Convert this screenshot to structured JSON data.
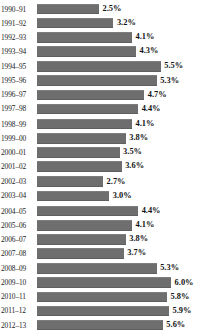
{
  "chart_data": {
    "type": "bar",
    "orientation": "horizontal",
    "title": "",
    "subtitle": "",
    "xlabel": "",
    "ylabel": "",
    "grid": false,
    "legend": null,
    "axis_visible": false,
    "tick_labels_x": [],
    "value_suffix": "%",
    "xlim": [
      0,
      6.6
    ],
    "bar_color": "#6e6e6e",
    "background_color": "#ffffff",
    "label_color": "#1a1a1a",
    "value_color": "#111111",
    "categories": [
      "1990–91",
      "1991–92",
      "1992–93",
      "1993–94",
      "1994–95",
      "1995–96",
      "1996–97",
      "1997–98",
      "1998–99",
      "1999–00",
      "2000–01",
      "2001–02",
      "2002–03",
      "2003–04",
      "2004–05",
      "2005–06",
      "2006–07",
      "2007–08",
      "2008–09",
      "2009–10",
      "2010–11",
      "2011–12",
      "2012–13"
    ],
    "values": [
      2.5,
      3.2,
      4.1,
      4.3,
      5.5,
      5.3,
      4.7,
      4.4,
      4.1,
      3.8,
      3.5,
      3.6,
      2.7,
      3.0,
      4.4,
      4.1,
      3.8,
      3.7,
      5.3,
      6.0,
      5.8,
      5.9,
      5.6
    ],
    "value_labels": [
      "2.5%",
      "3.2%",
      "4.1%",
      "4.3%",
      "5.5%",
      "5.3%",
      "4.7%",
      "4.4%",
      "4.1%",
      "3.8%",
      "3.5%",
      "3.6%",
      "2.7%",
      "3.0%",
      "4.4%",
      "4.1%",
      "3.8%",
      "3.7%",
      "5.3%",
      "6.0%",
      "5.8%",
      "5.9%",
      "5.6%"
    ]
  }
}
